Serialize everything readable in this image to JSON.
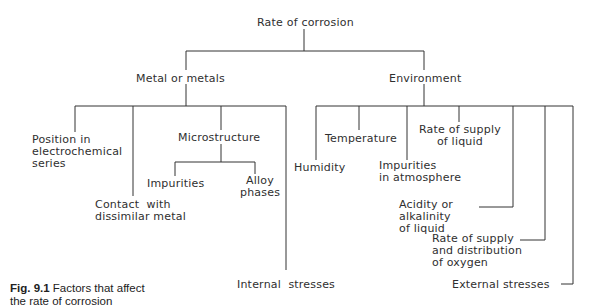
{
  "diagram": {
    "root": "Rate of corrosion",
    "branches": [
      {
        "label": "Metal or metals",
        "children": [
          "Position in\nelectrochemical\nseries",
          "Contact  with\ndissimilar metal",
          {
            "label": "Microstructure",
            "children": [
              "Impurities",
              "Alloy\nphases"
            ]
          },
          "Internal  stresses"
        ]
      },
      {
        "label": "Environment",
        "children": [
          "Humidity",
          "Temperature",
          "Impurities\nin atmosphere",
          "Rate of supply\nof liquid",
          "Acidity or\nalkalinity\nof liquid",
          "Rate of supply\nand distribution\nof oxygen",
          "External stresses"
        ]
      }
    ]
  },
  "labels": {
    "root": "Rate of corrosion",
    "metal": "Metal or metals",
    "environment": "Environment",
    "position": "Position in\nelectrochemical\nseries",
    "contact": "Contact  with\ndissimilar metal",
    "microstructure": "Microstructure",
    "impurities": "Impurities",
    "alloy": "Alloy\nphases",
    "internal": "Internal  stresses",
    "humidity": "Humidity",
    "temperature": "Temperature",
    "impurities_atm": "Impurities\nin atmosphere",
    "supply_liquid": "Rate of supply\nof liquid",
    "acidity": "Acidity or\nalkalinity\nof liquid",
    "oxygen": "Rate of supply\nand distribution\nof oxygen",
    "external": "External stresses"
  },
  "caption": {
    "fig_number": "Fig. 9.1",
    "text_line1": " Factors that affect",
    "text_line2": "the rate of corrosion"
  }
}
